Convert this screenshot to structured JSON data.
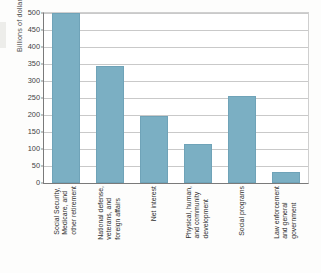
{
  "chart_data": {
    "type": "bar",
    "title": "",
    "xlabel": "",
    "ylabel": "Billions of dollars",
    "ylim": [
      0,
      500
    ],
    "grid": true,
    "legend": "none",
    "y_ticks": [
      500,
      450,
      400,
      350,
      300,
      250,
      200,
      150,
      100,
      50,
      0
    ],
    "categories": [
      "Social Security, Medicare, and other retirement",
      "National defense, veterans, and foreign affairs",
      "Net interest",
      "Physical, human, and community development",
      "Social programs",
      "Law enforcement and general government"
    ],
    "category_label_lines": [
      [
        "Social Security,",
        "Medicare, and",
        "other retirement"
      ],
      [
        "National defense,",
        "veterans, and",
        "foreign affairs"
      ],
      [
        "Net interest"
      ],
      [
        "Physical, human,",
        "and community",
        "development"
      ],
      [
        "Social programs"
      ],
      [
        "Law enforcement",
        "and general",
        "government"
      ]
    ],
    "values": [
      500,
      345,
      196,
      115,
      257,
      32
    ],
    "bar_color": "#7bafc3",
    "axis_color": "#7a7a7a",
    "gridline_color": "#c9c9c9"
  }
}
